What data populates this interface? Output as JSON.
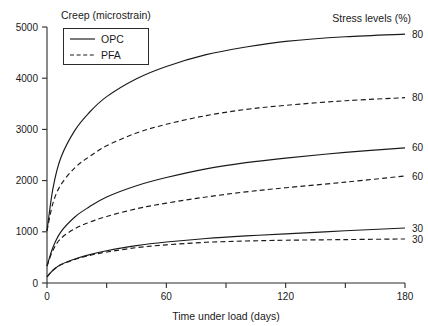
{
  "chart_data": {
    "type": "line",
    "title": "",
    "xlabel": "Time under load (days)",
    "ylabel": "Creep (microstrain)",
    "xlim": [
      0,
      180
    ],
    "ylim": [
      0,
      5000
    ],
    "grid": false,
    "xticks": [
      0,
      30,
      60,
      90,
      120,
      150,
      180
    ],
    "xticklabels": [
      "0",
      "",
      "60",
      "",
      "120",
      "",
      "180"
    ],
    "yticks": [
      0,
      1000,
      2000,
      3000,
      4000,
      5000
    ],
    "yticklabels": [
      "0",
      "1000",
      "2000",
      "3000",
      "4000",
      "5000"
    ],
    "legend": {
      "position": "upper-left-inside",
      "entries": [
        {
          "name": "OPC",
          "style": "solid"
        },
        {
          "name": "PFA",
          "style": "dashed"
        }
      ]
    },
    "annotations": {
      "series_group_title": "Stress levels (%)",
      "end_labels": [
        "80",
        "80",
        "60",
        "60",
        "30",
        "30"
      ]
    },
    "x": [
      0,
      3,
      7,
      14,
      21,
      30,
      45,
      60,
      80,
      100,
      120,
      150,
      180
    ],
    "series": [
      {
        "name": "OPC 80",
        "cement": "OPC",
        "stress_level": 80,
        "style": "solid",
        "end_label": "80",
        "values": [
          1020,
          1850,
          2450,
          2980,
          3320,
          3640,
          3990,
          4230,
          4460,
          4610,
          4720,
          4810,
          4860
        ]
      },
      {
        "name": "PFA 80",
        "cement": "PFA",
        "stress_level": 80,
        "style": "dashed",
        "end_label": "80",
        "values": [
          1020,
          1560,
          1920,
          2250,
          2460,
          2680,
          2930,
          3100,
          3270,
          3390,
          3470,
          3560,
          3620
        ]
      },
      {
        "name": "OPC 60",
        "cement": "OPC",
        "stress_level": 60,
        "style": "solid",
        "end_label": "60",
        "values": [
          330,
          700,
          1000,
          1290,
          1480,
          1680,
          1900,
          2060,
          2230,
          2350,
          2440,
          2550,
          2640
        ]
      },
      {
        "name": "PFA 60",
        "cement": "PFA",
        "stress_level": 60,
        "style": "dashed",
        "end_label": "60",
        "values": [
          330,
          640,
          870,
          1060,
          1180,
          1300,
          1450,
          1560,
          1680,
          1780,
          1860,
          1970,
          2090
        ]
      },
      {
        "name": "OPC 30",
        "cement": "OPC",
        "stress_level": 30,
        "style": "solid",
        "end_label": "30",
        "values": [
          120,
          250,
          360,
          470,
          550,
          630,
          730,
          800,
          870,
          920,
          960,
          1020,
          1075
        ]
      },
      {
        "name": "PFA 30",
        "cement": "PFA",
        "stress_level": 30,
        "style": "dashed",
        "end_label": "30",
        "values": [
          120,
          250,
          355,
          460,
          535,
          605,
          690,
          745,
          795,
          820,
          835,
          848,
          860
        ]
      }
    ]
  },
  "colors": {
    "line": "#1a1a1a",
    "axis": "#2b2b2b",
    "background": "#ffffff"
  }
}
